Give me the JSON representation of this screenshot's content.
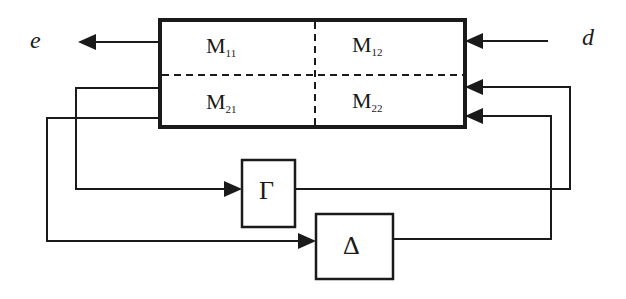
{
  "diagram": {
    "type": "block-diagram",
    "signals": {
      "output": "e",
      "input": "d"
    },
    "main_block": {
      "partitions": [
        {
          "name": "M",
          "sub": "11"
        },
        {
          "name": "M",
          "sub": "12"
        },
        {
          "name": "M",
          "sub": "21"
        },
        {
          "name": "M",
          "sub": "22"
        }
      ]
    },
    "feedback_blocks": {
      "gamma": "Γ",
      "delta": "Δ"
    },
    "colors": {
      "line": "#1a1a1a",
      "background": "#ffffff"
    }
  }
}
